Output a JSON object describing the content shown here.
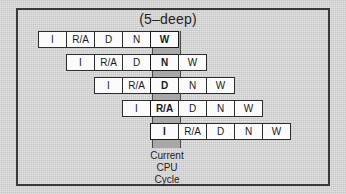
{
  "figure": {
    "title": "(5–deep)",
    "caption_lines": [
      "Current",
      "CPU",
      "Cycle"
    ],
    "colors": {
      "paper_background": "#d2d2d2",
      "frame_border": "#3a3a3a",
      "cell_fill": "#fbfbfb",
      "cell_border": "#2e2e2e",
      "highlight_band": "#a8a8a8",
      "text": "#232323"
    }
  },
  "chart_data": {
    "type": "table",
    "title": "(5–deep)",
    "stage_names": [
      "I",
      "R/A",
      "D",
      "N",
      "W"
    ],
    "pipeline_depth": 5,
    "current_cycle_column_index": 4,
    "rows": [
      {
        "instruction": 1,
        "offset": 0,
        "cells": [
          "I",
          "R/A",
          "D",
          "N",
          "W"
        ],
        "current_stage": "W"
      },
      {
        "instruction": 2,
        "offset": 1,
        "cells": [
          "I",
          "R/A",
          "D",
          "N",
          "W"
        ],
        "current_stage": "N"
      },
      {
        "instruction": 3,
        "offset": 2,
        "cells": [
          "I",
          "R/A",
          "D",
          "N",
          "W"
        ],
        "current_stage": "D"
      },
      {
        "instruction": 4,
        "offset": 3,
        "cells": [
          "I",
          "R/A",
          "D",
          "N",
          "W"
        ],
        "current_stage": "R/A"
      },
      {
        "instruction": 5,
        "offset": 4,
        "cells": [
          "I",
          "R/A",
          "D",
          "N",
          "W"
        ],
        "current_stage": "I"
      }
    ]
  }
}
